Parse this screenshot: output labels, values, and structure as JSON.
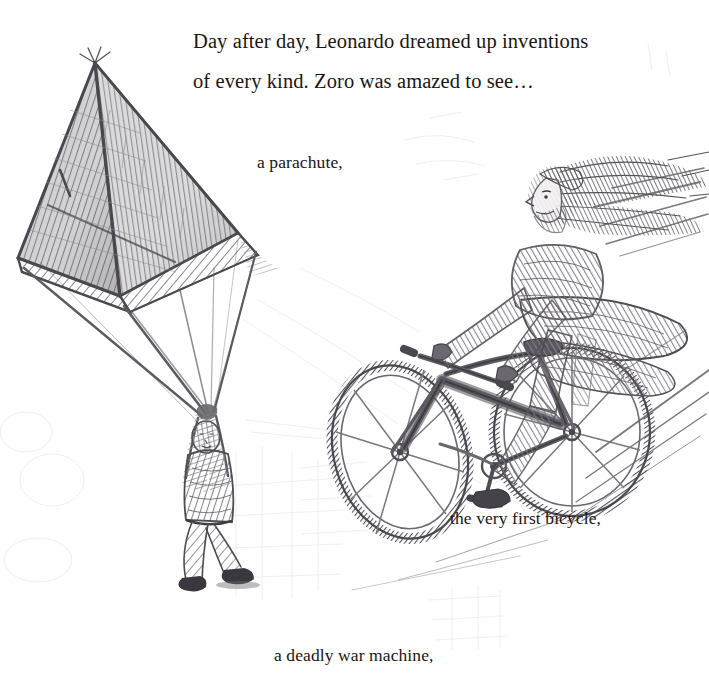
{
  "page": {
    "medium": "pencil-sketch",
    "paper_color": "#ffffff",
    "ink_color": "#1a1614",
    "graphite_color": "#6f6d70",
    "width": 709,
    "height": 700
  },
  "narration": {
    "line1": "Day after day, Leonardo dreamed up inventions",
    "line2": "of every kind. Zoro was amazed to see…"
  },
  "labels": {
    "parachute": "a parachute,",
    "bicycle": "the very first bicycle,",
    "war_machine": "a deadly war machine,"
  },
  "illustrations": [
    {
      "name": "parachute-illustration",
      "subject": "pyramidal parachute with hanging figure",
      "position": "left",
      "description": "Four-sided pyramid canopy rendered in crosshatched graphite, with rigging lines converging down to a small figure gripping the ropes with raised arms."
    },
    {
      "name": "bicycle-illustration",
      "subject": "rider on the very first bicycle",
      "position": "right",
      "description": "Long-haired bearded rider in a flowing cloak pedalling a wooden-framed bicycle down a diagonal, trailed by speed lines."
    },
    {
      "name": "background-ghost-sketches",
      "subject": "faint under-drawing of buildings and machinery",
      "position": "center-bottom",
      "description": "Very pale construction lines of architecture and a war machine showing through the paper."
    }
  ]
}
